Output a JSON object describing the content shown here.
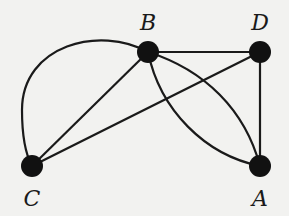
{
  "graph": {
    "nodes": [
      {
        "id": "A",
        "label": "A",
        "x": 260,
        "y": 166,
        "label_x": 260,
        "label_y": 204
      },
      {
        "id": "B",
        "label": "B",
        "x": 148,
        "y": 52,
        "label_x": 148,
        "label_y": 30
      },
      {
        "id": "C",
        "label": "C",
        "x": 32,
        "y": 166,
        "label_x": 32,
        "label_y": 204
      },
      {
        "id": "D",
        "label": "D",
        "x": 260,
        "y": 52,
        "label_x": 260,
        "label_y": 30
      }
    ],
    "edges": [
      {
        "from": "B",
        "to": "D",
        "type": "straight"
      },
      {
        "from": "D",
        "to": "A",
        "type": "straight"
      },
      {
        "from": "B",
        "to": "C",
        "type": "straight"
      },
      {
        "from": "D",
        "to": "C",
        "type": "straight"
      },
      {
        "from": "B",
        "to": "C",
        "type": "arc"
      },
      {
        "from": "B",
        "to": "A",
        "type": "arc-upper"
      },
      {
        "from": "B",
        "to": "A",
        "type": "arc-lower"
      }
    ],
    "colors": {
      "node": "#111111",
      "edge": "#1a1a1a",
      "background": "#f2f2f0"
    }
  }
}
